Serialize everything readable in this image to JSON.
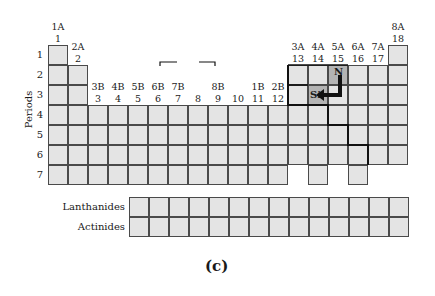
{
  "figure": {
    "caption": "(c)",
    "y_axis_title": "Periods",
    "periods": [
      "1",
      "2",
      "3",
      "4",
      "5",
      "6",
      "7"
    ],
    "group_labels": [
      {
        "col": 1,
        "old": "1A",
        "new": "1"
      },
      {
        "col": 2,
        "old": "2A",
        "new": "2"
      },
      {
        "col": 3,
        "old": "3B",
        "new": "3"
      },
      {
        "col": 4,
        "old": "4B",
        "new": "4"
      },
      {
        "col": 5,
        "old": "5B",
        "new": "5"
      },
      {
        "col": 6,
        "old": "6B",
        "new": "6"
      },
      {
        "col": 7,
        "old": "7B",
        "new": "7"
      },
      {
        "col": 8,
        "old": "",
        "new": "8"
      },
      {
        "col": 9,
        "old": "8B",
        "new": "9"
      },
      {
        "col": 10,
        "old": "",
        "new": "10"
      },
      {
        "col": 11,
        "old": "1B",
        "new": "11"
      },
      {
        "col": 12,
        "old": "2B",
        "new": "12"
      },
      {
        "col": 13,
        "old": "3A",
        "new": "13"
      },
      {
        "col": 14,
        "old": "4A",
        "new": "14"
      },
      {
        "col": 15,
        "old": "5A",
        "new": "15"
      },
      {
        "col": 16,
        "old": "6A",
        "new": "16"
      },
      {
        "col": 17,
        "old": "7A",
        "new": "17"
      },
      {
        "col": 18,
        "old": "8A",
        "new": "18"
      }
    ],
    "highlighted_elements": [
      {
        "symbol": "N",
        "group": 15,
        "period": 2
      },
      {
        "symbol": "Si",
        "group": 14,
        "period": 3
      }
    ],
    "arrow": {
      "from": "N",
      "to": "Si",
      "shape": "L-shaped"
    },
    "f_block_rows": [
      "Lanthanides",
      "Actinides"
    ],
    "f_block_cells_per_row": 14,
    "colors": {
      "cell_fill": "#e4e4e4",
      "highlight_fill": "#b4b4b4",
      "grid_line": "#4a4a4a",
      "thick_line": "#111111"
    }
  }
}
